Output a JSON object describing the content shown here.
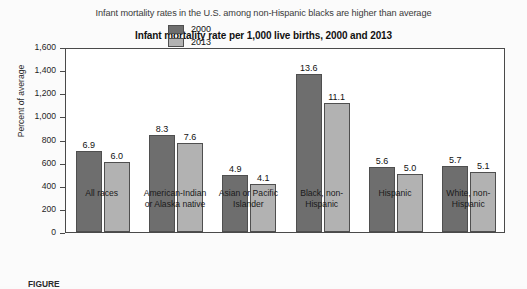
{
  "figure": {
    "headline": "Infant mortality rates in the U.S. among non-Hispanic blacks are higher than average",
    "caption": "FIGURE"
  },
  "legend": {
    "items": [
      {
        "label": "2000",
        "color": "#6e6e6e"
      },
      {
        "label": "2013",
        "color": "#b2b2b2"
      }
    ]
  },
  "axis": {
    "yticks": [
      "1,600",
      "1,400",
      "1,200",
      "1,000",
      "800",
      "600",
      "400",
      "200",
      "0"
    ]
  },
  "chart_data": {
    "type": "bar",
    "title": "Infant mortality rate per 1,000 live births, 2000 and 2013",
    "xlabel": "",
    "ylabel": "Percent of average",
    "ylim": [
      0,
      1600
    ],
    "ytick_values": [
      0,
      200,
      400,
      600,
      800,
      1000,
      1200,
      1400,
      1600
    ],
    "grid": false,
    "legend_position": "top-center",
    "value_unit": "deaths per 1,000 live births",
    "bar_height_unit": "percent of average",
    "categories": [
      "All races",
      "American-Indian or Alaska native",
      "Asian or Pacific Islander",
      "Black, non-Hispanic",
      "Hispanic",
      "White, non-Hispanic"
    ],
    "category_lines": [
      "All races",
      "American-Indian\nor Alaska native",
      "Asian or Pacific\nIslander",
      "Black, non-\nHispanic",
      "Hispanic",
      "White, non-\nHispanic"
    ],
    "series": [
      {
        "name": "2000",
        "color": "#6e6e6e",
        "values": [
          6.9,
          8.3,
          4.9,
          13.6,
          5.6,
          5.7
        ],
        "percent_of_average": [
          700,
          840,
          495,
          1370,
          565,
          575
        ]
      },
      {
        "name": "2013",
        "color": "#b2b2b2",
        "values": [
          6.0,
          7.6,
          4.1,
          11.1,
          5.0,
          5.1
        ],
        "percent_of_average": [
          605,
          770,
          415,
          1115,
          505,
          515
        ]
      }
    ]
  }
}
